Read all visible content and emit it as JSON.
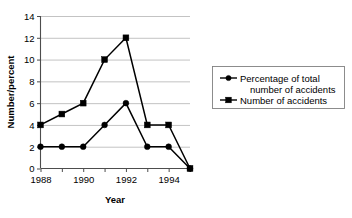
{
  "chart_data": {
    "type": "line",
    "title": "",
    "xlabel": "Year",
    "ylabel": "Number/percent",
    "x": [
      1988,
      1989,
      1990,
      1991,
      1992,
      1993,
      1994,
      1995
    ],
    "xtick_labels": [
      "1988",
      "",
      "1990",
      "",
      "1992",
      "",
      "1994",
      ""
    ],
    "xtick_labels_shown": [
      "1988",
      "1990",
      "1992",
      "1994"
    ],
    "ytick_labels": [
      "0",
      "2",
      "4",
      "6",
      "8",
      "10",
      "12",
      "14"
    ],
    "yticks": [
      0,
      2,
      4,
      6,
      8,
      10,
      12,
      14
    ],
    "ylim": [
      0,
      14
    ],
    "grid": "horizontal",
    "legend_position": "right",
    "series": [
      {
        "name": "Percentage of total number of accidents",
        "marker": "circle",
        "color": "#000000",
        "values": [
          2,
          2,
          2,
          4,
          6,
          2,
          2,
          0
        ]
      },
      {
        "name": "Number of accidents",
        "marker": "square",
        "color": "#000000",
        "values": [
          4,
          5,
          6,
          10,
          12,
          4,
          4,
          0
        ]
      }
    ]
  },
  "legend": {
    "entries": [
      {
        "label_line1": "Percentage of total",
        "label_line2": "number of accidents",
        "marker": "circle-marker"
      },
      {
        "label_line1": "Number of accidents",
        "label_line2": "",
        "marker": "square-marker"
      }
    ]
  },
  "colors": {
    "ink": "#000000",
    "grid": "#b4b4b4",
    "axis": "#4d4d4d",
    "legend_border": "#808080",
    "background": "#ffffff"
  }
}
